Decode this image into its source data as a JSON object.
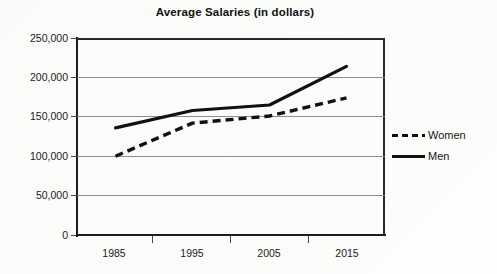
{
  "chart_data": {
    "type": "line",
    "title": "Average Salaries (in dollars)",
    "xlabel": "",
    "ylabel": "",
    "categories": [
      "1985",
      "1995",
      "2005",
      "2015"
    ],
    "x_tick_labels": [
      "1985",
      "1995",
      "2005",
      "2015"
    ],
    "y_tick_labels": [
      "250,000",
      "200,000",
      "150,000",
      "100,000",
      "50,000",
      "0"
    ],
    "y_tick_values": [
      250000,
      200000,
      150000,
      100000,
      50000,
      0
    ],
    "ylim": [
      0,
      250000
    ],
    "grid": "horizontal",
    "legend_position": "right",
    "series": [
      {
        "name": "Women",
        "style": "dashed",
        "color": "#111111",
        "values": [
          100000,
          142000,
          151000,
          174000
        ]
      },
      {
        "name": "Men",
        "style": "solid",
        "color": "#111111",
        "values": [
          136000,
          158000,
          165000,
          214000
        ]
      }
    ]
  },
  "legend": {
    "items": [
      {
        "label": "Women",
        "style": "dashed"
      },
      {
        "label": "Men",
        "style": "solid"
      }
    ]
  }
}
